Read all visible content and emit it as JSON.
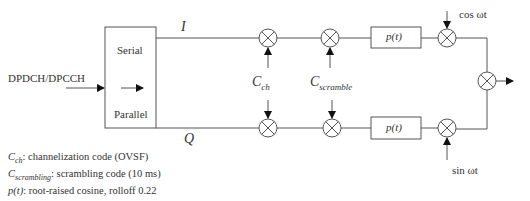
{
  "diagram": {
    "input_label": "DPDCH/DPCCH",
    "sp_converter": {
      "top_label": "Serial",
      "bottom_label": "Parallel"
    },
    "branches": {
      "I": "I",
      "Q": "Q"
    },
    "codes": {
      "channelization": {
        "symbol": "C",
        "sub": "ch"
      },
      "scramble": {
        "symbol": "C",
        "sub": "scramble"
      }
    },
    "filter_label": "p(t)",
    "carriers": {
      "cos": "cos ωt",
      "sin": "sin ωt"
    },
    "legend": [
      {
        "symbol": "C",
        "sub": "ch",
        "text": ": channelization code (OVSF)"
      },
      {
        "symbol": "C",
        "sub": "scrambling",
        "text": ": scrambling code (10 ms)"
      },
      {
        "symbol": "p(t)",
        "sub": "",
        "text": ": root-raised cosine, rolloff 0.22"
      }
    ],
    "colors": {
      "line": "#555555",
      "text": "#333333",
      "background": "#ffffff"
    }
  }
}
